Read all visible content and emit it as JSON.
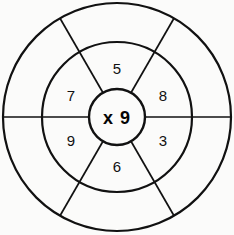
{
  "diagram": {
    "type": "multiplication-wheel",
    "background_color": "#fbfbfa",
    "line_color": "#111111",
    "hub": {
      "label": "x 9",
      "operator": "x",
      "multiplier": 9,
      "radius": 28,
      "center_x": 117,
      "center_y": 117
    },
    "rings": [
      {
        "name": "inner-ring",
        "radius": 75,
        "filled": true,
        "segment_count": 6
      },
      {
        "name": "outer-ring",
        "radius": 114,
        "filled": false,
        "segment_count": 6
      }
    ],
    "segments": [
      {
        "position": "top",
        "angle_deg": 270,
        "label": "5",
        "label_x": 117,
        "label_y": 68
      },
      {
        "position": "upper-right",
        "angle_deg": 330,
        "label": "8",
        "label_x": 163,
        "label_y": 95
      },
      {
        "position": "lower-right",
        "angle_deg": 30,
        "label": "3",
        "label_x": 163,
        "label_y": 140
      },
      {
        "position": "bottom",
        "angle_deg": 90,
        "label": "6",
        "label_x": 117,
        "label_y": 166
      },
      {
        "position": "lower-left",
        "angle_deg": 150,
        "label": "9",
        "label_x": 71,
        "label_y": 140
      },
      {
        "position": "upper-left",
        "angle_deg": 210,
        "label": "7",
        "label_x": 71,
        "label_y": 95
      }
    ],
    "spokes": [
      {
        "name": "spoke-left",
        "angle_deg": 180
      },
      {
        "name": "spoke-right",
        "angle_deg": 0
      },
      {
        "name": "spoke-upper-left",
        "angle_deg": 240
      },
      {
        "name": "spoke-upper-right",
        "angle_deg": 300
      },
      {
        "name": "spoke-lower-left",
        "angle_deg": 120
      },
      {
        "name": "spoke-lower-right",
        "angle_deg": 60
      }
    ]
  }
}
